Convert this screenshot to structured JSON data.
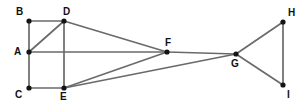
{
  "diagram": {
    "width": 307,
    "height": 107,
    "background_color": "#ffffff",
    "edge_color": "#6a6a6a",
    "vertex_color": "#141414",
    "label_color": "#111111",
    "vertices": [
      {
        "id": "A",
        "label": "A",
        "x": 29,
        "y": 52,
        "label_x": 14,
        "label_y": 47
      },
      {
        "id": "B",
        "label": "B",
        "x": 29,
        "y": 21,
        "label_x": 16,
        "label_y": 7
      },
      {
        "id": "C",
        "label": "C",
        "x": 29,
        "y": 88,
        "label_x": 15,
        "label_y": 90
      },
      {
        "id": "D",
        "label": "D",
        "x": 64,
        "y": 21,
        "label_x": 63,
        "label_y": 7
      },
      {
        "id": "E",
        "label": "E",
        "x": 64,
        "y": 88,
        "label_x": 60,
        "label_y": 92
      },
      {
        "id": "F",
        "label": "F",
        "x": 167,
        "y": 52,
        "label_x": 165,
        "label_y": 38
      },
      {
        "id": "G",
        "label": "G",
        "x": 236,
        "y": 54,
        "label_x": 231,
        "label_y": 59
      },
      {
        "id": "H",
        "label": "H",
        "x": 283,
        "y": 22,
        "label_x": 288,
        "label_y": 8
      },
      {
        "id": "I",
        "label": "I",
        "x": 283,
        "y": 85,
        "label_x": 287,
        "label_y": 90
      }
    ],
    "edges": [
      {
        "from": "A",
        "to": "B"
      },
      {
        "from": "B",
        "to": "D"
      },
      {
        "from": "A",
        "to": "D"
      },
      {
        "from": "A",
        "to": "C"
      },
      {
        "from": "A",
        "to": "F"
      },
      {
        "from": "D",
        "to": "E"
      },
      {
        "from": "D",
        "to": "F"
      },
      {
        "from": "C",
        "to": "E"
      },
      {
        "from": "E",
        "to": "F"
      },
      {
        "from": "E",
        "to": "G"
      },
      {
        "from": "F",
        "to": "G"
      },
      {
        "from": "G",
        "to": "H"
      },
      {
        "from": "G",
        "to": "I"
      },
      {
        "from": "H",
        "to": "I"
      }
    ]
  }
}
